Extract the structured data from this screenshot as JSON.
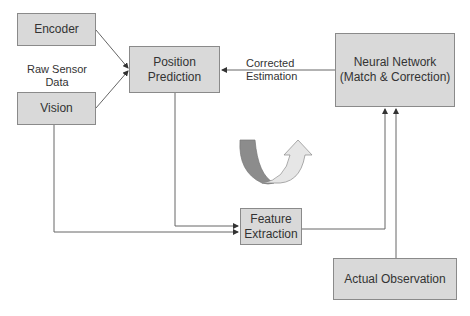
{
  "diagram": {
    "nodes": {
      "encoder": "Encoder",
      "vision": "Vision",
      "position_prediction": [
        "Position",
        "Prediction"
      ],
      "neural_network": [
        "Neural Network",
        "(Match & Correction)"
      ],
      "feature_extraction": [
        "Feature",
        "Extraction"
      ],
      "actual_observation": "Actual Observation"
    },
    "labels": {
      "raw_sensor": [
        "Raw Sensor",
        "Data"
      ],
      "corrected": [
        "Corrected",
        "Estimation"
      ]
    },
    "edges": [
      {
        "from": "Encoder",
        "to": "Position Prediction"
      },
      {
        "from": "Vision",
        "to": "Position Prediction"
      },
      {
        "from": "Neural Network",
        "to": "Position Prediction",
        "label": "Corrected Estimation"
      },
      {
        "from": "Position Prediction",
        "to": "Feature Extraction"
      },
      {
        "from": "Vision",
        "to": "Feature Extraction"
      },
      {
        "from": "Feature Extraction",
        "to": "Neural Network"
      },
      {
        "from": "Actual Observation",
        "to": "Neural Network"
      }
    ],
    "colors": {
      "box_fill": "#d9d9d9",
      "box_border": "#8a8a8a",
      "line": "#666666",
      "cycle_arrow_dark": "#8c8c8c",
      "cycle_arrow_light": "#e6e6e6"
    }
  }
}
